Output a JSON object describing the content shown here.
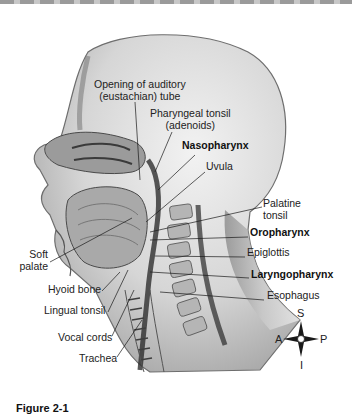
{
  "figure": {
    "caption": "Figure 2-1"
  },
  "labels": {
    "auditory_tube": {
      "line1": "Opening of auditory",
      "line2": "(eustachian) tube"
    },
    "pharyngeal_tonsil": {
      "line1": "Pharyngeal tonsil",
      "line2": "(adenoids)"
    },
    "nasopharynx": "Nasopharynx",
    "uvula": "Uvula",
    "palatine_tonsil": {
      "line1": "Palatine",
      "line2": "tonsil"
    },
    "oropharynx": "Oropharynx",
    "epiglottis": "Epiglottis",
    "laryngopharynx": "Laryngopharynx",
    "esophagus": "Esophagus",
    "soft_palate": {
      "line1": "Soft",
      "line2": "palate"
    },
    "hyoid_bone": "Hyoid bone",
    "lingual_tonsil": "Lingual tonsil",
    "vocal_cords": "Vocal cords",
    "trachea": "Trachea"
  },
  "compass": {
    "superior": "S",
    "inferior": "I",
    "anterior": "A",
    "posterior": "P"
  },
  "colors": {
    "skin": "#d9d9d9",
    "tissue": "#8c8c8c",
    "dark": "#3a3a3a",
    "leader": "#1a1a1a"
  }
}
